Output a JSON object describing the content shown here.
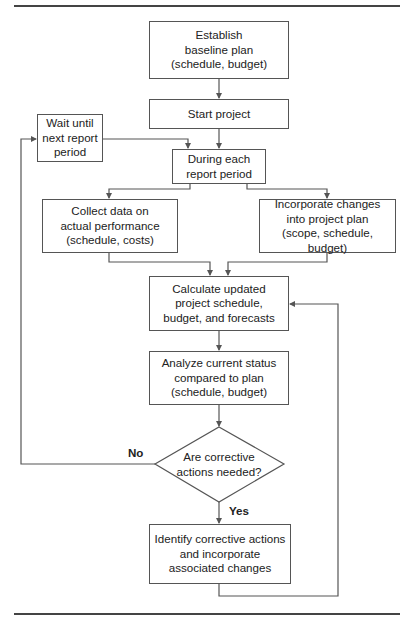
{
  "diagram": {
    "nodes": {
      "establish": {
        "text": "Establish\nbaseline plan\n(schedule, budget)"
      },
      "start": {
        "text": "Start project"
      },
      "wait": {
        "text": "Wait until\nnext report\nperiod"
      },
      "during": {
        "text": "During each\nreport period"
      },
      "collect": {
        "text": "Collect data on\nactual performance\n(schedule, costs)"
      },
      "incorporate": {
        "text": "Incorporate changes\ninto project plan\n(scope, schedule, budget)"
      },
      "calculate": {
        "text": "Calculate updated\nproject schedule,\nbudget, and forecasts"
      },
      "analyze": {
        "text": "Analyze current status\ncompared to plan\n(schedule, budget)"
      },
      "decision": {
        "text": "Are corrective\nactions needed?"
      },
      "identify": {
        "text": "Identify corrective actions\nand incorporate\nassociated changes"
      }
    },
    "labels": {
      "no": "No",
      "yes": "Yes"
    },
    "edges": [
      {
        "from": "establish",
        "to": "start"
      },
      {
        "from": "start",
        "to": "during"
      },
      {
        "from": "wait",
        "to": "during"
      },
      {
        "from": "during",
        "to": "collect"
      },
      {
        "from": "during",
        "to": "incorporate"
      },
      {
        "from": "collect",
        "to": "calculate"
      },
      {
        "from": "incorporate",
        "to": "calculate"
      },
      {
        "from": "calculate",
        "to": "analyze"
      },
      {
        "from": "analyze",
        "to": "decision"
      },
      {
        "from": "decision",
        "to": "wait",
        "label": "No"
      },
      {
        "from": "decision",
        "to": "identify",
        "label": "Yes"
      },
      {
        "from": "identify",
        "to": "calculate"
      }
    ],
    "colors": {
      "line": "#555555",
      "rule": "#444444",
      "text": "#222222"
    }
  }
}
